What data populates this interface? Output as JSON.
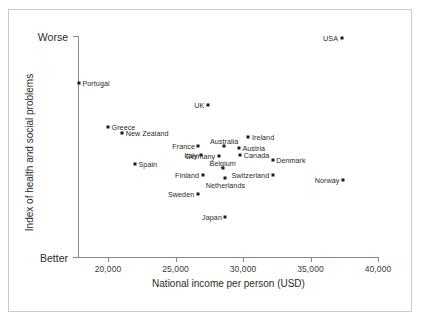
{
  "figure": {
    "x_axis_title": "National income per person (USD)",
    "y_axis_title": "Index of health and social problems",
    "y_top_label": "Worse",
    "y_bottom_label": "Better",
    "x_ticks": [
      "20,000",
      "25,000",
      "30,000",
      "35,000",
      "40,000"
    ]
  },
  "chart_data": {
    "type": "scatter",
    "title": "",
    "xlabel": "National income per person (USD)",
    "ylabel": "Index of health and social problems",
    "xlim": [
      17800,
      40000
    ],
    "ylim": [
      0,
      1
    ],
    "grid": false,
    "legend": null,
    "x_tick_values": [
      20000,
      25000,
      30000,
      35000,
      40000
    ],
    "x_tick_labels": [
      "20,000",
      "25,000",
      "30,000",
      "35,000",
      "40,000"
    ],
    "y_tick_labels": [
      "Better",
      "Worse"
    ],
    "y_axis_note": "Unitless index; higher = worse",
    "points": [
      {
        "label": "USA",
        "x": 37300,
        "y": 0.991,
        "label_side": "left"
      },
      {
        "label": "Portugal",
        "x": 17850,
        "y": 0.787,
        "label_side": "right"
      },
      {
        "label": "UK",
        "x": 27400,
        "y": 0.688,
        "label_side": "left"
      },
      {
        "label": "Greece",
        "x": 20000,
        "y": 0.588,
        "label_side": "right"
      },
      {
        "label": "New Zealand",
        "x": 21050,
        "y": 0.561,
        "label_side": "right"
      },
      {
        "label": "Ireland",
        "x": 30400,
        "y": 0.543,
        "label_side": "right"
      },
      {
        "label": "France",
        "x": 26700,
        "y": 0.502,
        "label_side": "left"
      },
      {
        "label": "Australia",
        "x": 28600,
        "y": 0.502,
        "label_side": "above"
      },
      {
        "label": "Austria",
        "x": 29700,
        "y": 0.493,
        "label_side": "right"
      },
      {
        "label": "Italy",
        "x": 26900,
        "y": 0.462,
        "label_side": "left"
      },
      {
        "label": "Germany",
        "x": 28200,
        "y": 0.457,
        "label_side": "left"
      },
      {
        "label": "Canada",
        "x": 29800,
        "y": 0.462,
        "label_side": "right"
      },
      {
        "label": "Denmark",
        "x": 32200,
        "y": 0.439,
        "label_side": "right"
      },
      {
        "label": "Spain",
        "x": 22000,
        "y": 0.421,
        "label_side": "right"
      },
      {
        "label": "Belgium",
        "x": 28500,
        "y": 0.403,
        "label_side": "above"
      },
      {
        "label": "Finland",
        "x": 27000,
        "y": 0.371,
        "label_side": "left"
      },
      {
        "label": "Switzerland",
        "x": 32200,
        "y": 0.371,
        "label_side": "left"
      },
      {
        "label": "Netherlands",
        "x": 28700,
        "y": 0.357,
        "label_side": "below"
      },
      {
        "label": "Norway",
        "x": 37400,
        "y": 0.348,
        "label_side": "left"
      },
      {
        "label": "Sweden",
        "x": 26650,
        "y": 0.285,
        "label_side": "left"
      },
      {
        "label": "Japan",
        "x": 28700,
        "y": 0.181,
        "label_side": "left"
      }
    ]
  }
}
